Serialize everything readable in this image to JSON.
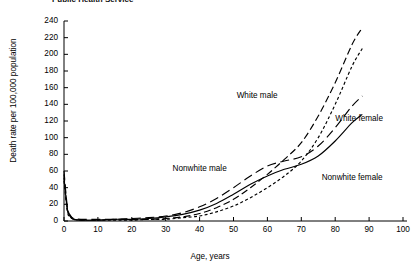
{
  "clipped_header": "Public Health Service",
  "axes": {
    "ylabel": "Death rate per 100,000 population",
    "xlabel": "Age, years",
    "yticks": [
      "0",
      "20",
      "40",
      "60",
      "80",
      "100",
      "120",
      "140",
      "160",
      "180",
      "200",
      "220",
      "240"
    ],
    "xticks": [
      "0",
      "10",
      "20",
      "30",
      "40",
      "50",
      "60",
      "70",
      "80",
      "90",
      "100"
    ]
  },
  "labels": {
    "white_male": "White male",
    "white_female": "White female",
    "nonwhite_male": "Nonwhite male",
    "nonwhite_female": "Nonwhite female"
  },
  "colors": {
    "ink": "#000000",
    "background": "#ffffff"
  },
  "chart_data": {
    "type": "line",
    "title": "",
    "xlabel": "Age, years",
    "ylabel": "Death rate per 100,000 population",
    "xlim": [
      0,
      100
    ],
    "ylim": [
      0,
      240
    ],
    "ytick_step": 20,
    "xtick_step": 10,
    "grid": false,
    "legend": "inline annotations next to each curve",
    "series": [
      {
        "name": "White male",
        "style": "long-dash",
        "x": [
          0,
          1,
          2,
          3,
          5,
          10,
          15,
          20,
          25,
          30,
          35,
          40,
          45,
          50,
          55,
          60,
          65,
          70,
          75,
          80,
          85,
          88
        ],
        "y": [
          56,
          14,
          5,
          2,
          1,
          1,
          2,
          2,
          2,
          3,
          5,
          9,
          16,
          26,
          40,
          56,
          74,
          94,
          126,
          166,
          212,
          232
        ]
      },
      {
        "name": "White female",
        "style": "short-dash",
        "x": [
          0,
          1,
          2,
          3,
          5,
          10,
          15,
          20,
          25,
          30,
          35,
          40,
          45,
          50,
          55,
          60,
          65,
          70,
          75,
          80,
          85,
          88
        ],
        "y": [
          48,
          11,
          4,
          2,
          1,
          1,
          1,
          1,
          2,
          2,
          4,
          6,
          11,
          18,
          28,
          40,
          54,
          72,
          100,
          140,
          186,
          207
        ]
      },
      {
        "name": "Nonwhite male",
        "style": "long-dash-wide",
        "x": [
          0,
          1,
          2,
          3,
          5,
          10,
          15,
          20,
          25,
          30,
          35,
          40,
          45,
          50,
          55,
          60,
          65,
          70,
          75,
          80,
          85,
          88
        ],
        "y": [
          60,
          17,
          6,
          3,
          2,
          2,
          2,
          3,
          4,
          6,
          10,
          17,
          27,
          40,
          54,
          66,
          72,
          77,
          90,
          112,
          138,
          150
        ]
      },
      {
        "name": "Nonwhite female",
        "style": "solid",
        "x": [
          0,
          1,
          2,
          3,
          5,
          10,
          15,
          20,
          25,
          30,
          35,
          40,
          45,
          50,
          55,
          60,
          65,
          70,
          75,
          80,
          85,
          88
        ],
        "y": [
          52,
          14,
          5,
          2,
          1,
          1,
          2,
          2,
          3,
          5,
          8,
          13,
          21,
          32,
          44,
          54,
          62,
          68,
          78,
          96,
          118,
          128
        ]
      }
    ],
    "annotations": [
      {
        "text": "White male",
        "x": 63,
        "y": 150
      },
      {
        "text": "White female",
        "x": 80,
        "y": 122
      },
      {
        "text": "Nonwhite male",
        "x": 48,
        "y": 62
      },
      {
        "text": "Nonwhite female",
        "x": 76,
        "y": 52
      }
    ]
  }
}
